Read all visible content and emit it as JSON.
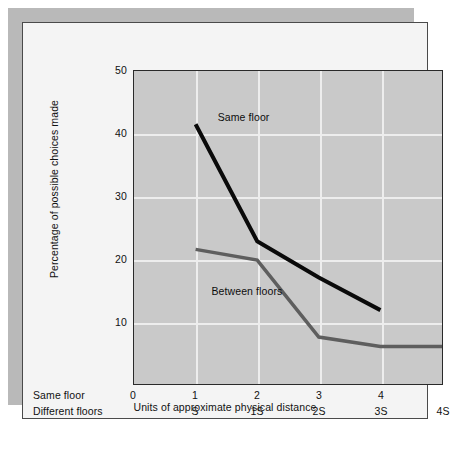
{
  "figure": {
    "background_color": "#ffffff",
    "card_color": "#f4f4f4",
    "shadow_color": "#b9b9b9",
    "plot_background_color": "#c9c9c9",
    "grid_color": "#ededed"
  },
  "chart_data": {
    "type": "line",
    "title": "",
    "xlabel": "Units of approximate physical distance",
    "ylabel": "Percentage of possible choices made",
    "ylim": [
      0,
      50
    ],
    "xlim": [
      0,
      5
    ],
    "yticks": [
      50,
      40,
      30,
      20,
      10
    ],
    "ytick_labels": [
      "50",
      "40",
      "30",
      "20",
      "10"
    ],
    "grid": true,
    "legend": "annotations-inline",
    "x_axis_rows": [
      {
        "row_label": "Same floor",
        "ticks": [
          "0",
          "1",
          "2",
          "3",
          "4"
        ],
        "tick_x": [
          0,
          1,
          2,
          3,
          4
        ]
      },
      {
        "row_label": "Different floors",
        "ticks": [
          "S",
          "1S",
          "2S",
          "3S",
          "4S"
        ],
        "tick_x": [
          1,
          2,
          3,
          4,
          5
        ]
      }
    ],
    "x": [
      1,
      2,
      3,
      4,
      5
    ],
    "series": [
      {
        "name": "Same floor",
        "color": "#0a0a0a",
        "line_width": 4,
        "values": [
          41.5,
          22.8,
          17.0,
          11.8,
          null
        ]
      },
      {
        "name": "Between floors",
        "color": "#5e5e5e",
        "line_width": 3.5,
        "values": [
          21.5,
          19.8,
          7.5,
          6.0,
          6.0
        ]
      }
    ],
    "annotations": [
      {
        "text": "Same floor",
        "x": 1.35,
        "y": 42.5
      },
      {
        "text": "Between floors",
        "x": 1.25,
        "y": 15.0
      }
    ]
  }
}
